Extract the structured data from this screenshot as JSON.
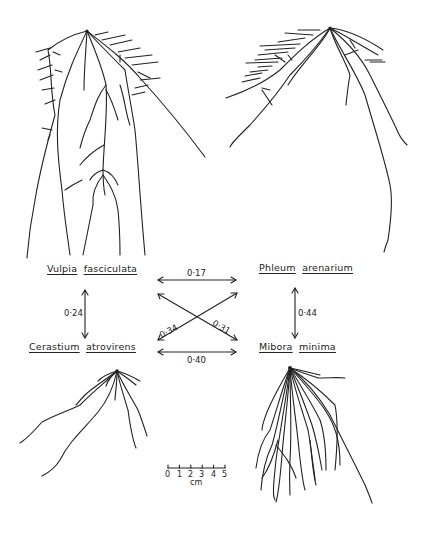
{
  "diagram": {
    "type": "root-system-correlation-diagram",
    "species": [
      {
        "id": "vulpia",
        "genus": "Vulpia",
        "epithet": "fasciculata",
        "position": "top-left"
      },
      {
        "id": "phleum",
        "genus": "Phleum",
        "epithet": "arenarium",
        "position": "top-right"
      },
      {
        "id": "cerastium",
        "genus": "Cerastium",
        "epithet": "atrovirens",
        "position": "bottom-left"
      },
      {
        "id": "mibora",
        "genus": "Mibora",
        "epithet": "minima",
        "position": "bottom-right"
      }
    ],
    "links": [
      {
        "from": "vulpia",
        "to": "phleum",
        "value": "0·17"
      },
      {
        "from": "vulpia",
        "to": "cerastium",
        "value": "0·24"
      },
      {
        "from": "phleum",
        "to": "mibora",
        "value": "0·44"
      },
      {
        "from": "phleum",
        "to": "cerastium",
        "value": "0·34"
      },
      {
        "from": "vulpia",
        "to": "mibora",
        "value": "0·31"
      },
      {
        "from": "cerastium",
        "to": "mibora",
        "value": "0·40"
      }
    ],
    "scale": {
      "ticks": [
        "0",
        "1",
        "2",
        "3",
        "4",
        "5"
      ],
      "unit": "cm"
    },
    "colors": {
      "ink": "#222222",
      "background": "#ffffff"
    }
  }
}
